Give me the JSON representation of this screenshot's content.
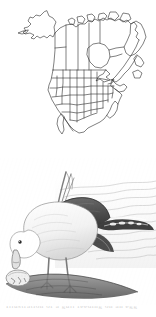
{
  "page": {
    "width_px": 156,
    "height_px": 317,
    "background_color": "#ffffff"
  },
  "range_map": {
    "title": "North America range map",
    "alt_text": "Outline map of North America showing United States states, Canadian provinces and Alaska",
    "style": "line art outline, no fill",
    "line_color": "#2b2b2b",
    "fill_color": "#ffffff",
    "regions": [
      "Alaska",
      "Yukon",
      "Northwest Territories",
      "Nunavut",
      "British Columbia",
      "Alberta",
      "Saskatchewan",
      "Manitoba",
      "Ontario",
      "Quebec",
      "Labrador",
      "Newfoundland",
      "Maritimes",
      "Contiguous United States",
      "Baja California",
      "Northern Mexico"
    ]
  },
  "plate": {
    "title": "Gull feeding on an egg",
    "alt_text": "Engraving of a large black-backed gull standing on a shoreline, head lowered, feeding on a broken egg, with reeds and water behind",
    "medium": "steel engraving, grayscale",
    "ink_color": "#4a4a4a",
    "paper_color": "#ffffff",
    "elements": [
      "gull",
      "dark mantle",
      "white head and breast",
      "black wingtips",
      "pale legs",
      "broken egg",
      "shoreline mound",
      "reed stems",
      "water ripples"
    ]
  },
  "caption": {
    "text": "Illustration of a gull feeding on an egg",
    "state": "clipped at page edge"
  },
  "colors": {
    "ink": "#2b2b2b",
    "plate_ink": "#4a4a4a",
    "paper": "#ffffff",
    "caption_grey": "#c9c9c9"
  }
}
